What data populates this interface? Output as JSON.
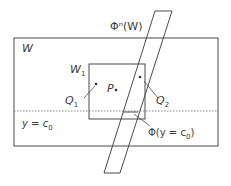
{
  "diagram": {
    "title": "",
    "labels": {
      "phi_n_W": "Φⁿ(W)",
      "W": "W",
      "W1": "W",
      "W1_sub": "1",
      "P": "P",
      "Q1": "Q",
      "Q1_sub": "1",
      "Q2": "Q",
      "Q2_sub": "2",
      "y_eq_c0": "y = c",
      "y_eq_c0_sub": "0",
      "phi_y_c0": "Φ(y = c",
      "phi_y_c0_sub": "0",
      "phi_y_c0_close": ")"
    },
    "shapes": {
      "W_rect": {
        "x": 14,
        "y": 38,
        "w": 204,
        "h": 108
      },
      "W1_rect": {
        "x": 89,
        "y": 64,
        "w": 56,
        "h": 55
      },
      "dotted_line_y": 111,
      "parallelogram": [
        [
          155,
          11
        ],
        [
          172,
          11
        ],
        [
          120,
          173
        ],
        [
          104,
          173
        ]
      ]
    },
    "points": {
      "P": [
        116,
        90
      ],
      "Q1": [
        96,
        84
      ],
      "Q2": [
        140,
        77
      ]
    },
    "colors": {
      "stroke": "#4a4a4a",
      "dotted": "#8a8a8a",
      "background": "#ffffff"
    }
  }
}
